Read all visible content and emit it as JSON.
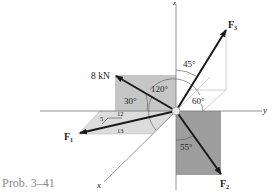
{
  "figure": {
    "caption": "Prob. 3–41",
    "axes": {
      "x": "x",
      "y": "y",
      "z": "z"
    },
    "forces": {
      "F1": {
        "label": "F",
        "sub": "1",
        "slope": {
          "a": "5",
          "b": "12",
          "hyp": "13"
        }
      },
      "F2": {
        "label": "F",
        "sub": "2",
        "angle": "55°"
      },
      "F3": {
        "label": "F",
        "sub": "3",
        "angle_z": "45°",
        "angle_plane": "60°"
      },
      "F4": {
        "label": "8 kN",
        "angle_horiz": "30°",
        "angle_x": "120°"
      }
    },
    "colors": {
      "plane_light": "#d9d9d9",
      "plane_mid": "#c6c6c6",
      "plane_dark": "#9e9e9e",
      "arrow": "#1a1a1a",
      "axis": "#7a7a7a"
    }
  }
}
